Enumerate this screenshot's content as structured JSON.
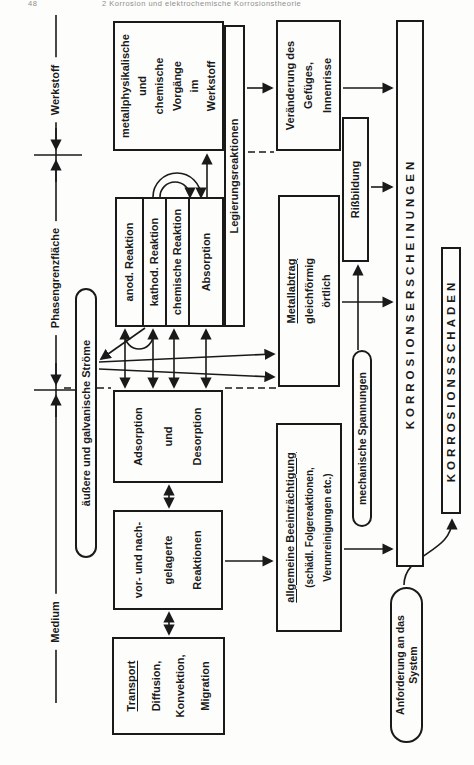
{
  "page": {
    "page_number": "48",
    "header_title": "2 Korrosion und elektrochemische Korrosionstheorie"
  },
  "axis": {
    "medium": "Medium",
    "phasengrenzflaeche": "Phasengrenzfläche",
    "werkstoff": "Werkstoff"
  },
  "transport": {
    "title": "Transport",
    "l1": "Diffusion,",
    "l2": "Konvektion,",
    "l3": "Migration"
  },
  "vor": {
    "l1": "vor- und nach-",
    "l2": "gelagerte",
    "l3": "Reaktionen"
  },
  "adsorption": {
    "l1": "Adsorption",
    "l2": "und",
    "l3": "Desorption"
  },
  "cluster": {
    "r1": "anod. Reaktion",
    "r2": "kathod. Reaktion",
    "r3": "chemische Reaktion",
    "r4": "Absorption"
  },
  "metallphysik": {
    "l1": "metallphysikalische",
    "l2": "und",
    "l3": "chemische",
    "l4": "Vorgänge",
    "l5": "im",
    "l6": "Werkstoff"
  },
  "legierung": {
    "label": "Legierungsreaktionen"
  },
  "veraenderung": {
    "l1": "Veränderung des",
    "l2": "Gefüges,",
    "l3": "Innenrisse"
  },
  "metallabtrag": {
    "title": "Metallabtrag",
    "l1": "gleichförmig",
    "l2": "örtlich"
  },
  "rissbildung": {
    "label": "Rißbildung"
  },
  "allgemeine": {
    "title": "allgemeine Beeinträchtigung",
    "l1": "(schädl. Folgereaktionen,",
    "l2": "Verunreinigungen etc.)"
  },
  "stroeme": {
    "label": "äußere und galvanische Ströme"
  },
  "spannungen": {
    "label": "mechanische Spannungen"
  },
  "anforderung": {
    "l1": "Anforderung an das",
    "l2": "System"
  },
  "erscheinungen": {
    "label": "KORROSIONSERSCHEINUNGEN"
  },
  "schaden": {
    "label": "KORROSIONSSCHADEN"
  },
  "colors": {
    "ink": "#1a1a1a",
    "paper": "#fdfdfb"
  }
}
